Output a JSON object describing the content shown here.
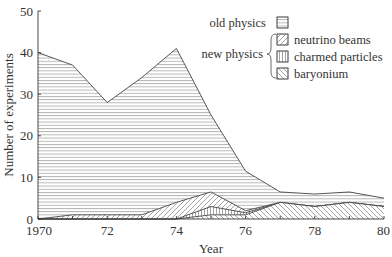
{
  "chart_data": {
    "type": "area",
    "stacked": true,
    "title": "",
    "xlabel": "Year",
    "ylabel": "Number of experiments",
    "x": [
      1970,
      1971,
      1972,
      1973,
      1974,
      1975,
      1976,
      1977,
      1978,
      1979,
      1980
    ],
    "x_tick_labels": [
      "1970",
      "72",
      "74",
      "76",
      "78",
      "80"
    ],
    "x_tick_values": [
      1970,
      1972,
      1974,
      1976,
      1978,
      1980
    ],
    "y_tick_values": [
      0,
      10,
      20,
      30,
      40,
      50
    ],
    "ylim": [
      0,
      50
    ],
    "xlim": [
      1970,
      1980
    ],
    "grid": false,
    "legend_position": "top-right",
    "series": [
      {
        "name": "baryonium",
        "group": "new physics",
        "pattern": "diag-back",
        "values": [
          0,
          0,
          0,
          0,
          0,
          1,
          1,
          4,
          3,
          4,
          3
        ]
      },
      {
        "name": "charmed particles",
        "group": "new physics",
        "pattern": "vertical",
        "values": [
          0,
          0,
          0,
          0,
          0,
          2,
          0.5,
          0,
          0,
          0,
          0
        ]
      },
      {
        "name": "neutrino beams",
        "group": "new physics",
        "pattern": "diag-fwd",
        "values": [
          0,
          1,
          1,
          1,
          4,
          3.5,
          0.5,
          0,
          0,
          0,
          0
        ]
      },
      {
        "name": "old physics",
        "group": "old physics",
        "pattern": "horizontal",
        "values": [
          40,
          36,
          27,
          33,
          37,
          18.5,
          9.5,
          2.5,
          3,
          2.5,
          2
        ]
      }
    ],
    "cumulative_tops": {
      "baryonium": [
        0,
        0,
        0,
        0,
        0,
        1,
        1,
        4,
        3,
        4,
        3
      ],
      "charmed particles": [
        0,
        0,
        0,
        0,
        0,
        3,
        1.5,
        4,
        3,
        4,
        3
      ],
      "neutrino beams": [
        0,
        1,
        1,
        1,
        4,
        6.5,
        2,
        4,
        3,
        4,
        3
      ],
      "old physics": [
        40,
        37,
        28,
        34,
        41,
        25,
        11.5,
        6.5,
        6,
        6.5,
        5
      ]
    }
  },
  "legend": {
    "old_label": "old physics",
    "new_label": "new physics",
    "items": [
      "neutrino beams",
      "charmed particles",
      "baryonium"
    ]
  }
}
